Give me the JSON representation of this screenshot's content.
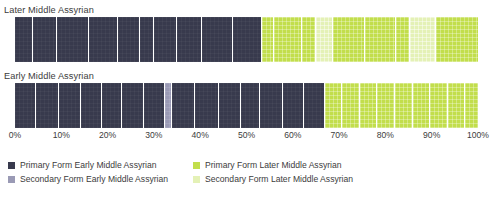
{
  "chart_data": {
    "type": "bar",
    "orientation": "horizontal",
    "stacked": true,
    "title": "",
    "xlabel": "",
    "ylabel": "",
    "xlim": [
      0,
      100
    ],
    "grid": false,
    "legend_position": "bottom",
    "categories": [
      "Later Middle Assyrian",
      "Early Middle Assyrian"
    ],
    "tick_labels": [
      "0%",
      "10%",
      "20%",
      "30%",
      "40%",
      "50%",
      "60%",
      "70%",
      "80%",
      "90%",
      "100%"
    ],
    "tick_values": [
      0,
      10,
      20,
      30,
      40,
      50,
      60,
      70,
      80,
      90,
      100
    ],
    "series": [
      {
        "name": "Primary Form Early Middle Assyrian",
        "color": "#383a4d",
        "values": [
          53.3,
          65.5
        ]
      },
      {
        "name": "Secondary Form Early Middle Assyrian",
        "color": "#9a9ab5",
        "values": [
          0,
          1.4
        ]
      },
      {
        "name": "Primary Form Later Middle Assyrian",
        "color": "#c2de4c",
        "values": [
          37.7,
          33.1
        ]
      },
      {
        "name": "Secondary Form Later Middle Assyrian",
        "color": "#e4f1b6",
        "values": [
          9.0,
          0
        ]
      }
    ],
    "bars": [
      {
        "label": "Later Middle Assyrian",
        "segments": [
          {
            "series": "Primary Form Early Middle Assyrian",
            "class": "pf-early",
            "width": 3.9
          },
          {
            "series": "Primary Form Early Middle Assyrian",
            "class": "pf-early",
            "width": 5.2
          },
          {
            "series": "Primary Form Early Middle Assyrian",
            "class": "pf-early",
            "width": 6.9
          },
          {
            "series": "Primary Form Early Middle Assyrian",
            "class": "pf-early",
            "width": 6.3
          },
          {
            "series": "Primary Form Early Middle Assyrian",
            "class": "pf-early",
            "width": 4.6
          },
          {
            "series": "Primary Form Early Middle Assyrian",
            "class": "pf-early",
            "width": 3.2
          },
          {
            "series": "Primary Form Early Middle Assyrian",
            "class": "pf-early",
            "width": 5.0
          },
          {
            "series": "Primary Form Early Middle Assyrian",
            "class": "pf-early",
            "width": 5.4
          },
          {
            "series": "Primary Form Early Middle Assyrian",
            "class": "pf-early",
            "width": 6.5
          },
          {
            "series": "Primary Form Early Middle Assyrian",
            "class": "pf-early",
            "width": 6.3
          },
          {
            "series": "Primary Form Later Middle Assyrian",
            "class": "pf-later",
            "width": 2.6
          },
          {
            "series": "Primary Form Later Middle Assyrian",
            "class": "pf-later",
            "width": 6.0
          },
          {
            "series": "Primary Form Later Middle Assyrian",
            "class": "pf-later",
            "width": 3.2
          },
          {
            "series": "Secondary Form Later Middle Assyrian",
            "class": "sf-later",
            "width": 3.5
          },
          {
            "series": "Primary Form Later Middle Assyrian",
            "class": "pf-later",
            "width": 7.1
          },
          {
            "series": "Primary Form Later Middle Assyrian",
            "class": "pf-later",
            "width": 6.7
          },
          {
            "series": "Primary Form Later Middle Assyrian",
            "class": "pf-later",
            "width": 3.0
          },
          {
            "series": "Secondary Form Later Middle Assyrian",
            "class": "sf-later",
            "width": 5.5
          },
          {
            "series": "Primary Form Later Middle Assyrian",
            "class": "pf-later",
            "width": 9.1
          }
        ]
      },
      {
        "label": "Early Middle Assyrian",
        "segments": [
          {
            "series": "Primary Form Early Middle Assyrian",
            "class": "pf-early",
            "width": 4.6
          },
          {
            "series": "Primary Form Early Middle Assyrian",
            "class": "pf-early",
            "width": 4.8
          },
          {
            "series": "Primary Form Early Middle Assyrian",
            "class": "pf-early",
            "width": 4.8
          },
          {
            "series": "Primary Form Early Middle Assyrian",
            "class": "pf-early",
            "width": 4.6
          },
          {
            "series": "Primary Form Early Middle Assyrian",
            "class": "pf-early",
            "width": 4.3
          },
          {
            "series": "Primary Form Early Middle Assyrian",
            "class": "pf-early",
            "width": 4.8
          },
          {
            "series": "Primary Form Early Middle Assyrian",
            "class": "pf-early",
            "width": 4.6
          },
          {
            "series": "Secondary Form Early Middle Assyrian",
            "class": "sf-early",
            "width": 1.4
          },
          {
            "series": "Primary Form Early Middle Assyrian",
            "class": "pf-early",
            "width": 5.0
          },
          {
            "series": "Primary Form Early Middle Assyrian",
            "class": "pf-early",
            "width": 5.2
          },
          {
            "series": "Primary Form Early Middle Assyrian",
            "class": "pf-early",
            "width": 4.8
          },
          {
            "series": "Primary Form Early Middle Assyrian",
            "class": "pf-early",
            "width": 4.1
          },
          {
            "series": "Primary Form Early Middle Assyrian",
            "class": "pf-early",
            "width": 4.8
          },
          {
            "series": "Primary Form Early Middle Assyrian",
            "class": "pf-early",
            "width": 4.6
          },
          {
            "series": "Primary Form Early Middle Assyrian",
            "class": "pf-early",
            "width": 4.5
          },
          {
            "series": "Primary Form Later Middle Assyrian",
            "class": "pf-later",
            "width": 3.7
          },
          {
            "series": "Primary Form Later Middle Assyrian",
            "class": "pf-later",
            "width": 3.9
          },
          {
            "series": "Primary Form Later Middle Assyrian",
            "class": "pf-later",
            "width": 3.7
          },
          {
            "series": "Primary Form Later Middle Assyrian",
            "class": "pf-later",
            "width": 3.9
          },
          {
            "series": "Primary Form Later Middle Assyrian",
            "class": "pf-later",
            "width": 3.9
          },
          {
            "series": "Primary Form Later Middle Assyrian",
            "class": "pf-later",
            "width": 3.7
          },
          {
            "series": "Primary Form Later Middle Assyrian",
            "class": "pf-later",
            "width": 3.9
          },
          {
            "series": "Primary Form Later Middle Assyrian",
            "class": "pf-later",
            "width": 3.7
          },
          {
            "series": "Primary Form Later Middle Assyrian",
            "class": "pf-later",
            "width": 2.7
          }
        ]
      }
    ]
  },
  "legend": {
    "items": [
      {
        "label": "Primary Form Early Middle Assyrian",
        "class": "pf-early",
        "color": "#383a4d"
      },
      {
        "label": "Primary Form Later Middle Assyrian",
        "class": "pf-later",
        "color": "#c2de4c"
      },
      {
        "label": "Secondary Form Early Middle Assyrian",
        "class": "sf-early",
        "color": "#9a9ab5"
      },
      {
        "label": "Secondary Form Later Middle Assyrian",
        "class": "sf-later",
        "color": "#e4f1b6"
      }
    ]
  },
  "footnote": ""
}
